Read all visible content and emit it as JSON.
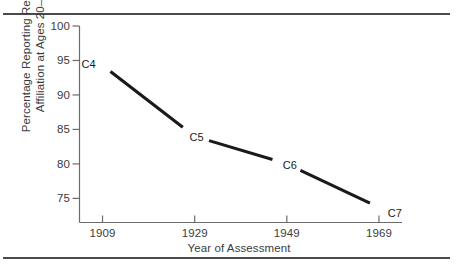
{
  "figure": {
    "background_color": "#ffffff",
    "rule_color": "#4a4a4a",
    "axis_color": "#6b6b6b",
    "line_color": "#1a1a1a",
    "text_color": "#3b3b3b"
  },
  "chart_data": {
    "type": "line",
    "title": "",
    "subtitle": "",
    "xlabel": "Year of Assessment",
    "ylabel_line1": "Percentage Reporting Religious",
    "ylabel_line2": "Affiliation at Ages 20–30",
    "ylabel": "Percentage Reporting Religious Affiliation at Ages 20–30",
    "x": [
      1909,
      1929,
      1949,
      1969
    ],
    "values": [
      94.3,
      84.0,
      80.0,
      73.7
    ],
    "point_labels": [
      "C4",
      "C5",
      "C6",
      "C7"
    ],
    "series": [
      {
        "name": "Cohort trend",
        "values": [
          94.3,
          84.0,
          80.0,
          73.7
        ]
      }
    ],
    "xticks": [
      "1909",
      "1929",
      "1949",
      "1969"
    ],
    "xtick_values": [
      1909,
      1929,
      1949,
      1969
    ],
    "yticks": [
      "100",
      "95",
      "90",
      "85",
      "80",
      "75"
    ],
    "ytick_values": [
      100,
      95,
      90,
      85,
      80,
      75
    ],
    "xlim": [
      1904,
      1974
    ],
    "ylim": [
      71.5,
      100
    ],
    "grid": false,
    "legend": false,
    "legend_position": "none",
    "annotations": [
      {
        "label": "C4",
        "x": 1909,
        "y": 94.3
      },
      {
        "label": "C5",
        "x": 1929,
        "y": 84.0
      },
      {
        "label": "C6",
        "x": 1949,
        "y": 80.0
      },
      {
        "label": "C7",
        "x": 1969,
        "y": 73.7
      }
    ]
  }
}
